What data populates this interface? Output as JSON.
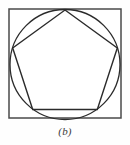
{
  "figure": {
    "caption": "(b)",
    "background_color": "#fefefe",
    "interior_fill": "#ffffff",
    "stroke_color": "#2b2b2b",
    "square_stroke_color": "#4a4a4a",
    "canvas": {
      "width": 130,
      "height": 145
    },
    "square": {
      "name": "outer-square",
      "x": 9.0,
      "y": 9.0,
      "width": 112.0,
      "height": 109.0,
      "stroke_width": 1.5
    },
    "circle": {
      "name": "inscribed-circle",
      "cx": 65.0,
      "cy": 64.5,
      "r": 55.0,
      "stroke_width": 1.3
    },
    "pentagon": {
      "name": "inscribed-pentagon",
      "sides": 5,
      "stroke_width": 1.4,
      "points": "65,10 117.3,48.0 97.3,109.5 32.7,109.5 12.7,48.0",
      "vertices": [
        {
          "label": "apex-top",
          "x": 65.0,
          "y": 10.0
        },
        {
          "label": "upper-right",
          "x": 117.3,
          "y": 48.0
        },
        {
          "label": "lower-right",
          "x": 97.3,
          "y": 109.5
        },
        {
          "label": "lower-left",
          "x": 32.7,
          "y": 109.5
        },
        {
          "label": "upper-left",
          "x": 12.7,
          "y": 48.0
        }
      ]
    }
  }
}
